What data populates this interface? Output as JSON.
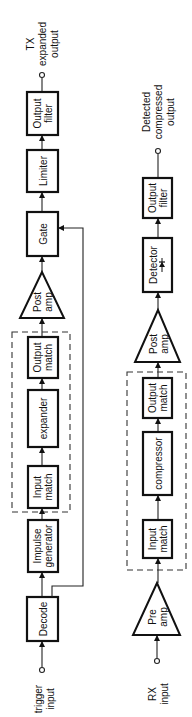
{
  "diagram": {
    "tx_chain": {
      "output_label": [
        "TX",
        "expanded",
        "output"
      ],
      "input_label": [
        "trigger",
        "input"
      ],
      "blocks": {
        "output_filter": [
          "Output",
          "filter"
        ],
        "limiter": [
          "Limiter"
        ],
        "gate": [
          "Gate"
        ],
        "post_amp": [
          "Post",
          "amp"
        ],
        "output_match": [
          "Output",
          "match"
        ],
        "expander": [
          "expander"
        ],
        "input_match": [
          "Input",
          "match"
        ],
        "impulse_generator": [
          "Impulse",
          "generator"
        ],
        "decode": [
          "Decode"
        ]
      }
    },
    "rx_chain": {
      "output_label": [
        "Detected",
        "compressed",
        "output"
      ],
      "input_label": [
        "RX",
        "input"
      ],
      "blocks": {
        "output_filter": [
          "Output",
          "filter"
        ],
        "detector": [
          "Detector"
        ],
        "post_amp": [
          "Post",
          "amp"
        ],
        "output_match": [
          "Output",
          "match"
        ],
        "compressor": [
          "compressor"
        ],
        "input_match": [
          "Input",
          "match"
        ],
        "pre_amp": [
          "Pre",
          "amp"
        ]
      }
    }
  }
}
